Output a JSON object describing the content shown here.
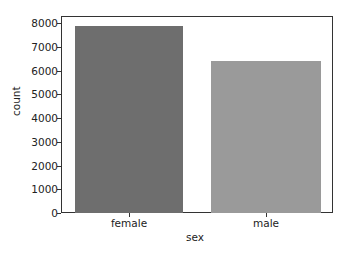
{
  "chart_data": {
    "type": "bar",
    "title": "",
    "categories": [
      "female",
      "male"
    ],
    "values": [
      7870,
      6400
    ],
    "colors": [
      "#6e6e6e",
      "#9a9a9a"
    ],
    "xlabel": "sex",
    "ylabel": "count",
    "ylim": [
      0,
      8300
    ],
    "yticks": [
      "0",
      "1000",
      "2000",
      "3000",
      "4000",
      "5000",
      "6000",
      "7000",
      "8000"
    ],
    "grid": false,
    "legend": null
  }
}
